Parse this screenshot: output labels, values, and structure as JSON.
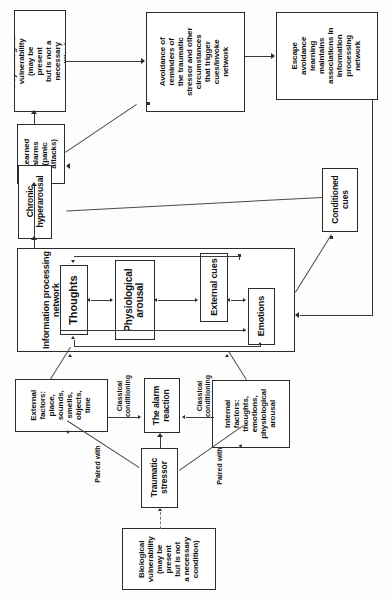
{
  "diagram": {
    "orientation": "text-rotated-90-ccw",
    "nodes": {
      "psychological_vulnerability": "Psychological\nvulnerability\n(may be\npresent\nbut is not a\nnecessary\ncondition)",
      "learned_alarms": "Learned\nalarms\n(panic\nattacks)",
      "chronic_hyperarousal": "Chronic\nhyperarousal",
      "avoidance": "Avoidance of\nreminders of\nthe traumatic\nstressor and other\ncircumstances\nthat trigger\ncues/invoke\nnetwork",
      "escape_avoidance": "Escape\navoidance\nlearning\nmaintains\nassociations in\ninformation\nprocessing\nnetwork",
      "conditioned_cues": "Conditioned\ncues",
      "information_processing_network": "Information processing\nnetwork",
      "thoughts": "Thoughts",
      "physiological_arousal": "Physiological\narousal",
      "external_cues": "External cues",
      "emotions": "Emotions",
      "external_factors": "External\nfactors:\nplace,\nsounds,\nsmells,\nobjects,\ntime",
      "internal_factors": "Internal\nfactors:\nthoughts,\nemotions,\nphysiological\narousal",
      "the_alarm_reaction": "The alarm\nreaction",
      "traumatic_stressor": "Traumatic\nstressor",
      "biological_vulnerability": "Biological\nvulnerability\n(may be\npresent\nbut is not\na necessary\ncondition)"
    },
    "edge_labels": {
      "classical_conditioning_left": "Classical\nconditioning",
      "classical_conditioning_right": "Classical\nconditioning",
      "paired_with_left": "Paired with",
      "paired_with_right": "Paired with"
    },
    "colors": {
      "box_border": "#2b2b2b",
      "connector": "#3a3a3a",
      "text": "#111111",
      "background": "#ffffff",
      "dashed_connector": "#777777"
    }
  }
}
